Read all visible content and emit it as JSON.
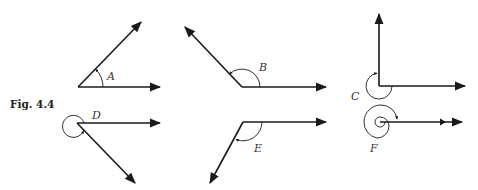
{
  "figure": {
    "caption": "Fig. 4.4",
    "angles": [
      {
        "id": "A",
        "label": "A",
        "type": "acute"
      },
      {
        "id": "B",
        "label": "B",
        "type": "obtuse"
      },
      {
        "id": "C",
        "label": "C",
        "type": "reflex-270"
      },
      {
        "id": "D",
        "label": "D",
        "type": "reflex"
      },
      {
        "id": "E",
        "label": "E",
        "type": "obtuse-below"
      },
      {
        "id": "F",
        "label": "F",
        "type": "multiple-revolution"
      }
    ]
  },
  "colors": {
    "ink": "#1a1a1a",
    "background": "#ffffff"
  }
}
